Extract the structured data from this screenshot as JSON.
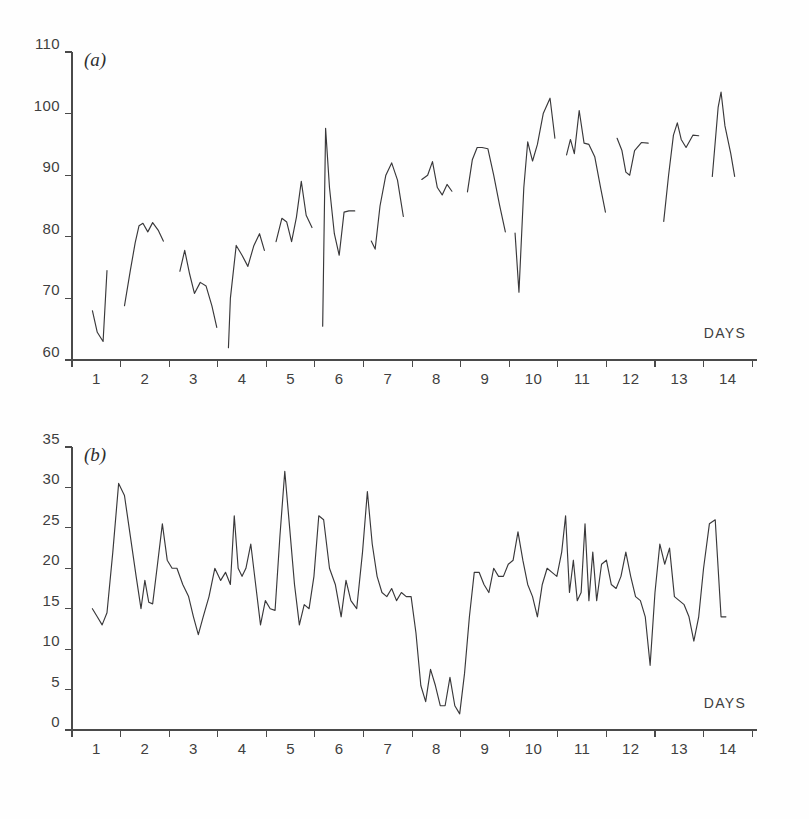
{
  "figure": {
    "background_color": "#fefefe",
    "trace_color": "#39383a",
    "axis_color": "#4a4a4a",
    "panels": [
      "a",
      "b"
    ]
  },
  "panel_a": {
    "label": "(a)",
    "x_axis_title": "DAYS"
  },
  "panel_b": {
    "label": "(b)",
    "x_axis_title": "DAYS"
  },
  "chart_data": [
    {
      "type": "line",
      "title": "(a)",
      "panel": "a",
      "xlabel": "DAYS",
      "ylabel": "",
      "xlim": [
        0.5,
        14.6
      ],
      "ylim": [
        60,
        110
      ],
      "grid": false,
      "legend": null,
      "xticks": [
        1,
        2,
        3,
        4,
        5,
        6,
        7,
        8,
        9,
        10,
        11,
        12,
        13,
        14
      ],
      "xticklabels": [
        "1",
        "2",
        "3",
        "4",
        "5",
        "6",
        "7",
        "8",
        "9",
        "10",
        "11",
        "12",
        "13",
        "14"
      ],
      "yticks": [
        60,
        70,
        80,
        90,
        100,
        110
      ],
      "yticklabels": [
        "60",
        "70",
        "80",
        "90",
        "100",
        "110"
      ],
      "segmented": true,
      "note": "Daily recording segments separated by gaps; each day is a separate trace.",
      "segments": [
        {
          "day": 1,
          "x": [
            0.92,
            1.02,
            1.14,
            1.22
          ],
          "y": [
            68.0,
            64.5,
            63.0,
            74.5
          ]
        },
        {
          "day": 2,
          "x": [
            1.58,
            1.7,
            1.8,
            1.88,
            1.96,
            2.06,
            2.16,
            2.28,
            2.38
          ],
          "y": [
            68.8,
            74.5,
            79.0,
            81.8,
            82.2,
            80.8,
            82.3,
            81.0,
            79.3
          ]
        },
        {
          "day": 3,
          "x": [
            2.72,
            2.82,
            2.92,
            3.02,
            3.14,
            3.26,
            3.38,
            3.48
          ],
          "y": [
            74.4,
            77.8,
            74.0,
            70.8,
            72.6,
            72.0,
            68.8,
            65.3
          ]
        },
        {
          "day": 4,
          "x": [
            3.72,
            3.76,
            3.88,
            4.0,
            4.12,
            4.24,
            4.36,
            4.46
          ],
          "y": [
            62.0,
            70.0,
            78.6,
            77.0,
            75.2,
            78.5,
            80.5,
            77.8
          ]
        },
        {
          "day": 5,
          "x": [
            4.7,
            4.82,
            4.92,
            5.02,
            5.12,
            5.22,
            5.32,
            5.44
          ],
          "y": [
            79.2,
            83.0,
            82.4,
            79.2,
            83.2,
            89.0,
            83.5,
            81.5
          ]
        },
        {
          "day": 6,
          "x": [
            5.66,
            5.72,
            5.8,
            5.9,
            6.0,
            6.1,
            6.2,
            6.32
          ],
          "y": [
            65.5,
            97.6,
            88.0,
            80.5,
            77.0,
            84.0,
            84.2,
            84.2
          ]
        },
        {
          "day": 7,
          "x": [
            6.66,
            6.74,
            6.84,
            6.96,
            7.08,
            7.2,
            7.32
          ],
          "y": [
            79.3,
            78.0,
            85.0,
            90.0,
            92.0,
            89.2,
            83.3
          ]
        },
        {
          "day": 8,
          "x": [
            7.7,
            7.82,
            7.92,
            8.02,
            8.12,
            8.22,
            8.32
          ],
          "y": [
            89.3,
            90.0,
            92.2,
            88.0,
            86.8,
            88.5,
            87.4
          ]
        },
        {
          "day": 9,
          "x": [
            8.64,
            8.74,
            8.84,
            8.94,
            9.06,
            9.18,
            9.3,
            9.42
          ],
          "y": [
            87.3,
            92.5,
            94.5,
            94.5,
            94.3,
            90.0,
            85.2,
            80.8
          ]
        },
        {
          "day": 10,
          "x": [
            9.62,
            9.7,
            9.8,
            9.88,
            9.98,
            10.08,
            10.2,
            10.34,
            10.44
          ],
          "y": [
            80.6,
            71.0,
            88.0,
            95.4,
            92.3,
            95.0,
            100.0,
            102.5,
            96.0
          ]
        },
        {
          "day": 11,
          "x": [
            10.68,
            10.76,
            10.84,
            10.94,
            11.04,
            11.14,
            11.26,
            11.38,
            11.48
          ],
          "y": [
            93.3,
            95.8,
            93.5,
            100.5,
            95.2,
            95.0,
            93.0,
            88.0,
            84.0
          ]
        },
        {
          "day": 12,
          "x": [
            11.72,
            11.82,
            11.9,
            11.98,
            12.08,
            12.22,
            12.36
          ],
          "y": [
            96.0,
            94.0,
            90.5,
            90.0,
            94.0,
            95.3,
            95.2
          ]
        },
        {
          "day": 13,
          "x": [
            12.68,
            12.78,
            12.88,
            12.96,
            13.04,
            13.14,
            13.28,
            13.4
          ],
          "y": [
            82.5,
            90.0,
            96.5,
            98.5,
            95.8,
            94.5,
            96.5,
            96.4
          ]
        },
        {
          "day": 14,
          "x": [
            13.68,
            13.8,
            13.86,
            13.94,
            14.06,
            14.14
          ],
          "y": [
            89.8,
            101.0,
            103.5,
            98.0,
            93.5,
            89.8
          ]
        }
      ]
    },
    {
      "type": "line",
      "title": "(b)",
      "panel": "b",
      "xlabel": "DAYS",
      "ylabel": "",
      "xlim": [
        0.5,
        14.6
      ],
      "ylim": [
        0,
        35
      ],
      "grid": false,
      "legend": null,
      "xticks": [
        1,
        2,
        3,
        4,
        5,
        6,
        7,
        8,
        9,
        10,
        11,
        12,
        13,
        14
      ],
      "xticklabels": [
        "1",
        "2",
        "3",
        "4",
        "5",
        "6",
        "7",
        "8",
        "9",
        "10",
        "11",
        "12",
        "13",
        "14"
      ],
      "yticks": [
        0,
        5,
        10,
        15,
        20,
        25,
        30,
        35
      ],
      "yticklabels": [
        "0",
        "5",
        "10",
        "15",
        "20",
        "25",
        "30",
        "35"
      ],
      "segmented": false,
      "note": "Continuous recording across all 14 days; deep trough between days 7.5 and 8.5.",
      "x": [
        0.92,
        1.02,
        1.12,
        1.22,
        1.34,
        1.46,
        1.58,
        1.7,
        1.82,
        1.92,
        2.0,
        2.08,
        2.16,
        2.26,
        2.36,
        2.46,
        2.56,
        2.66,
        2.78,
        2.9,
        3.0,
        3.1,
        3.2,
        3.32,
        3.44,
        3.56,
        3.66,
        3.76,
        3.84,
        3.92,
        4.0,
        4.08,
        4.18,
        4.28,
        4.38,
        4.48,
        4.58,
        4.68,
        4.78,
        4.88,
        4.98,
        5.08,
        5.18,
        5.28,
        5.38,
        5.48,
        5.58,
        5.68,
        5.8,
        5.92,
        6.04,
        6.14,
        6.24,
        6.36,
        6.48,
        6.58,
        6.68,
        6.78,
        6.88,
        6.98,
        7.08,
        7.18,
        7.28,
        7.38,
        7.48,
        7.58,
        7.68,
        7.78,
        7.88,
        7.98,
        8.08,
        8.18,
        8.28,
        8.38,
        8.48,
        8.58,
        8.68,
        8.78,
        8.88,
        8.98,
        9.08,
        9.18,
        9.28,
        9.38,
        9.48,
        9.58,
        9.68,
        9.78,
        9.88,
        9.98,
        10.08,
        10.18,
        10.28,
        10.38,
        10.48,
        10.58,
        10.66,
        10.74,
        10.82,
        10.9,
        10.98,
        11.06,
        11.14,
        11.22,
        11.3,
        11.4,
        11.5,
        11.6,
        11.7,
        11.8,
        11.9,
        12.0,
        12.1,
        12.2,
        12.3,
        12.4,
        12.5,
        12.6,
        12.7,
        12.8,
        12.9,
        13.0,
        13.1,
        13.2,
        13.3,
        13.4,
        13.5,
        13.62,
        13.74,
        13.86,
        13.96,
        14.06,
        14.18
      ],
      "y": [
        15.0,
        14.0,
        13.0,
        14.5,
        22.0,
        30.5,
        29.0,
        24.0,
        19.0,
        15.0,
        18.5,
        15.8,
        15.6,
        20.5,
        25.5,
        21.0,
        20.0,
        20.0,
        18.0,
        16.5,
        14.0,
        11.8,
        14.0,
        16.5,
        20.0,
        18.5,
        19.5,
        18.0,
        26.5,
        20.0,
        19.0,
        20.0,
        23.0,
        18.0,
        13.0,
        16.0,
        15.0,
        14.8,
        24.0,
        32.0,
        25.0,
        18.0,
        13.0,
        15.5,
        15.0,
        19.0,
        26.5,
        26.0,
        20.0,
        18.0,
        14.0,
        18.5,
        16.0,
        15.0,
        22.0,
        29.5,
        23.0,
        19.0,
        17.0,
        16.5,
        17.5,
        16.0,
        17.0,
        16.5,
        16.5,
        12.0,
        5.5,
        3.5,
        7.5,
        5.5,
        3.0,
        3.0,
        6.5,
        3.0,
        2.0,
        7.0,
        14.0,
        19.5,
        19.5,
        18.0,
        17.0,
        20.0,
        19.0,
        19.0,
        20.5,
        21.0,
        24.5,
        21.0,
        18.0,
        16.5,
        14.0,
        18.0,
        20.0,
        19.5,
        19.0,
        22.0,
        26.5,
        17.0,
        21.0,
        16.0,
        17.0,
        25.5,
        16.0,
        22.0,
        16.0,
        20.5,
        21.0,
        18.0,
        17.5,
        19.0,
        22.0,
        19.0,
        16.5,
        16.0,
        14.0,
        8.0,
        17.0,
        23.0,
        20.5,
        22.5,
        16.5,
        16.0,
        15.5,
        14.0,
        11.0,
        14.0,
        20.0,
        25.5,
        26.0,
        14.0,
        14.0
      ]
    }
  ]
}
